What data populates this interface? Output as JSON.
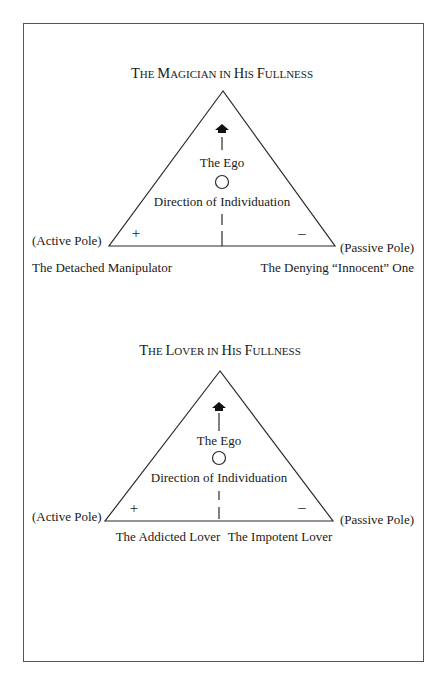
{
  "diagrams": [
    {
      "title_caps": [
        "T",
        "HE ",
        "M",
        "AGICIAN IN ",
        "H",
        "IS ",
        "F",
        "ULLNESS"
      ],
      "title": "The Magician in His Fullness",
      "top_label": "The Ego",
      "center_label": "Direction of Individuation",
      "plus_sign": "+",
      "minus_sign": "–",
      "left_pole": "(Active Pole)",
      "right_pole": "(Passive Pole)",
      "left_shadow": "The Detached Manipulator",
      "right_shadow": "The Denying “Innocent” One"
    },
    {
      "title": "The Lover in His Fullness",
      "top_label": "The Ego",
      "center_label": "Direction of Individuation",
      "plus_sign": "+",
      "minus_sign": "–",
      "left_pole": "(Active Pole)",
      "right_pole": "(Passive Pole)",
      "left_shadow": "The Addicted Lover",
      "right_shadow": "The Impotent Lover"
    }
  ],
  "colors": {
    "line": "#2a2a2a",
    "frame": "#555555",
    "background": "#ffffff"
  }
}
